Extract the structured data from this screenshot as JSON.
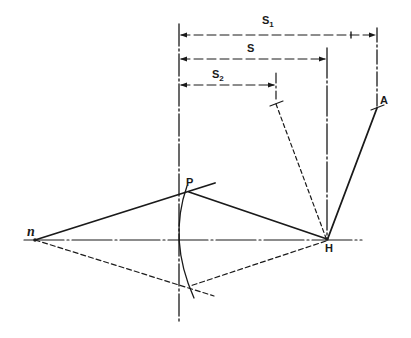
{
  "diagram": {
    "type": "geometric construction",
    "labels": {
      "s1": "S",
      "s1_sub": "1",
      "s": "S",
      "s2": "S",
      "s2_sub": "2",
      "a": "A",
      "p": "P",
      "h": "H",
      "n": "n"
    },
    "colors": {
      "ink": "#1a1a1a",
      "background": "#ffffff"
    },
    "points": {
      "n": [
        35,
        240
      ],
      "P": [
        189,
        192
      ],
      "H": [
        327,
        239
      ],
      "A": [
        377,
        108
      ],
      "S2_end": [
        276,
        104
      ],
      "lower_intersection": [
        189,
        286
      ]
    },
    "dimensions": [
      {
        "name": "S1",
        "y": 35,
        "x_from": 179,
        "x_to": 377
      },
      {
        "name": "S",
        "y": 59,
        "x_from": 179,
        "x_to": 327
      },
      {
        "name": "S2",
        "y": 85,
        "x_from": 179,
        "x_to": 276
      }
    ]
  }
}
